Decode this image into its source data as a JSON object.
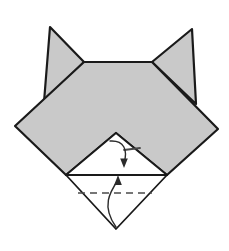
{
  "figure": {
    "canvas": {
      "width": 229,
      "height": 251
    },
    "colors": {
      "paper_fill": "#c9c9c9",
      "paper_back_fill": "#ffffff",
      "outline": "#1a1a1a",
      "fold_line": "#4a4a4a",
      "arrow": "#2b2b2b",
      "background": "#ffffff"
    },
    "stroke_widths": {
      "outline": 2.2,
      "inner_edge": 1.6,
      "dashed_fold": 1.5,
      "arrow": 1.3
    },
    "shapes": [
      {
        "name": "left-ear",
        "kind": "triangle",
        "fill": "paper_fill",
        "points": "50,27 84,62 44,102"
      },
      {
        "name": "right-ear",
        "kind": "triangle",
        "fill": "paper_fill",
        "points": "192,29 152,62 196,104"
      },
      {
        "name": "head-body",
        "kind": "polygon",
        "fill": "paper_fill",
        "points": "84,62 152,62 218,129 167,175 116,133 66,175 15,126"
      },
      {
        "name": "inner-muzzle-triangle",
        "kind": "triangle",
        "fill": "paper_back_fill",
        "points": "116,133 167,175 66,175"
      },
      {
        "name": "lower-flap-triangle",
        "kind": "triangle",
        "fill": "paper_back_fill",
        "points": "66,175 167,175 116,229"
      }
    ],
    "fold_lines": [
      {
        "name": "upper-valley-fold-dash",
        "kind": "dash-segment",
        "x1": 124,
        "y1": 150,
        "x2": 140,
        "y2": 148
      },
      {
        "name": "lower-valley-fold-dashed",
        "kind": "dashed-line",
        "x1": 78,
        "y1": 193,
        "x2": 152,
        "y2": 193
      }
    ],
    "arrows": [
      {
        "name": "fold-down-arrow",
        "direction": "down",
        "path": "M 110,141 C 124,140 128,150 124,163",
        "head_at": {
          "x": 124,
          "y": 166
        }
      },
      {
        "name": "fold-up-arrow",
        "direction": "up",
        "path": "M 116,227 C 101,206 110,192 118,180",
        "head_at": {
          "x": 118,
          "y": 177
        }
      }
    ],
    "labels": {
      "caption": "",
      "step_number": ""
    }
  }
}
